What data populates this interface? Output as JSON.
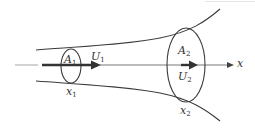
{
  "figure": {
    "colors": {
      "stroke": "#3a3a3a",
      "axis": "#555555",
      "background": "#ffffff"
    },
    "axis": {
      "label": "x",
      "direction": "left-to-right"
    },
    "section_1": {
      "area_label": "A",
      "area_sub": "1",
      "velocity_label": "U",
      "velocity_sub": "1",
      "position_label": "x",
      "position_sub": "1"
    },
    "section_2": {
      "area_label": "A",
      "area_sub": "2",
      "velocity_label": "U",
      "velocity_sub": "2",
      "position_label": "x",
      "position_sub": "2"
    }
  }
}
